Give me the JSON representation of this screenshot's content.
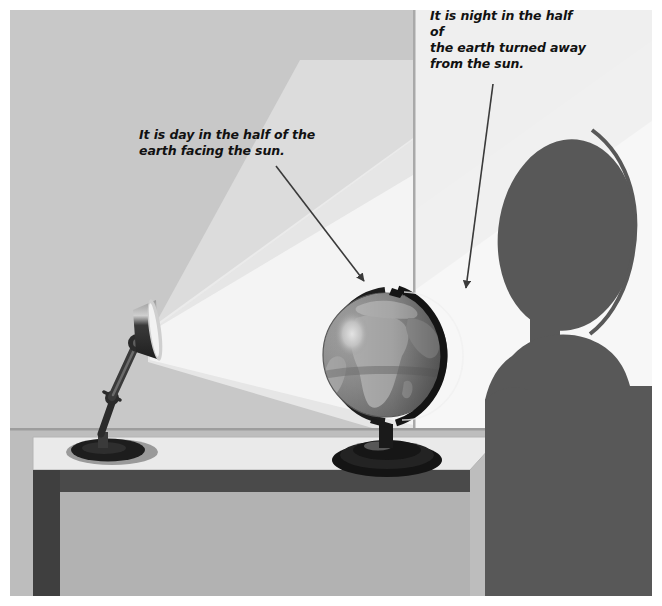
{
  "figure": {
    "frame_color": "#ffffff"
  },
  "annotations": [
    {
      "id": "day",
      "name": "caption-day",
      "text": "It is day in the half of the\nearth facing the sun.",
      "arrow_label": "arrow-to-lit-side",
      "points_at": "lit side of the globe"
    },
    {
      "id": "night",
      "name": "caption-night",
      "text": "It is night in the half of\nthe earth turned away\nfrom the sun.",
      "arrow_label": "arrow-to-dark-side",
      "points_at": "dark side of the globe"
    }
  ],
  "scene": {
    "wall_left_label": "shaded wall",
    "wall_lit_label": "lit wall",
    "floor_label": "floor",
    "desk_label": "desk",
    "lamp_label": "desk lamp",
    "globe_label": "globe",
    "person_label": "person silhouette",
    "light_beam_label": "light beam"
  },
  "colors": {
    "wall_shaded": "#c8c8c8",
    "wall_lit": "#fbfbfb",
    "wall_mid": "#e3e3e3",
    "beam_bright": "#f2f2f2",
    "beam_soft": "#dcdcdc",
    "floor": "#bdbdbd",
    "desk_top": "#e8e8e8",
    "desk_edge": "#4a4a4a",
    "desk_leg": "#3f3f3f",
    "lamp_dark": "#2b2b2b",
    "lamp_metal": "#8e8e8e",
    "globe_ocean_lit": "#8f8f8f",
    "globe_ocean_dark": "#6a6a6a",
    "globe_land_lit": "#b6b6b6",
    "globe_land_dark": "#7d7d7d",
    "globe_ring": "#1d1d1d",
    "globe_base": "#1a1a1a",
    "person": "#585858",
    "arrow": "#3a3a3a",
    "text": "#111111"
  }
}
